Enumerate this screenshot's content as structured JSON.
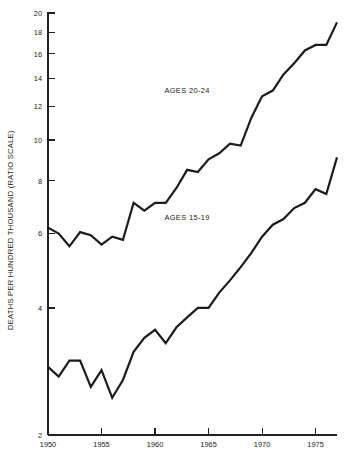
{
  "chart_data": {
    "type": "line",
    "title": "",
    "xlabel": "",
    "ylabel": "DEATHS PER HUNDRED THOUSAND (RATIO SCALE)",
    "yscale": "log",
    "ylim": [
      2,
      20
    ],
    "xlim": [
      1950,
      1977
    ],
    "grid": false,
    "legend_position": "inline-annotation",
    "ytick_labels": [
      "20",
      "18",
      "16",
      "14",
      "12",
      "10",
      "8",
      "6",
      "4",
      "2"
    ],
    "ytick_values": [
      20,
      18,
      16,
      14,
      12,
      10,
      8,
      6,
      4,
      2
    ],
    "xtick_labels": [
      "1950",
      "1955",
      "1960",
      "1965",
      "1970",
      "1975"
    ],
    "xtick_values": [
      1950,
      1955,
      1960,
      1965,
      1970,
      1975
    ],
    "x": [
      1950,
      1951,
      1952,
      1953,
      1954,
      1955,
      1956,
      1957,
      1958,
      1959,
      1960,
      1961,
      1962,
      1963,
      1964,
      1965,
      1966,
      1967,
      1968,
      1969,
      1970,
      1971,
      1972,
      1973,
      1974,
      1975,
      1976,
      1977
    ],
    "series": [
      {
        "name": "AGES 20-24",
        "label": "AGES 20-24",
        "label_x": 1963.0,
        "label_y": 12.9,
        "values": [
          6.2,
          6.0,
          5.6,
          6.05,
          5.95,
          5.65,
          5.9,
          5.8,
          7.1,
          6.8,
          7.1,
          7.1,
          7.7,
          8.5,
          8.4,
          9.0,
          9.3,
          9.8,
          9.7,
          11.3,
          12.7,
          13.1,
          14.3,
          15.2,
          16.3,
          16.8,
          16.8,
          19.0
        ]
      },
      {
        "name": "AGES 15-19",
        "label": "AGES 15-19",
        "label_x": 1963.0,
        "label_y": 6.45,
        "values": [
          2.9,
          2.75,
          3.0,
          3.0,
          2.6,
          2.85,
          2.45,
          2.7,
          3.15,
          3.4,
          3.55,
          3.3,
          3.6,
          3.8,
          4.0,
          4.0,
          4.35,
          4.65,
          5.0,
          5.4,
          5.9,
          6.3,
          6.5,
          6.9,
          7.1,
          7.65,
          7.45,
          9.1
        ]
      }
    ]
  }
}
